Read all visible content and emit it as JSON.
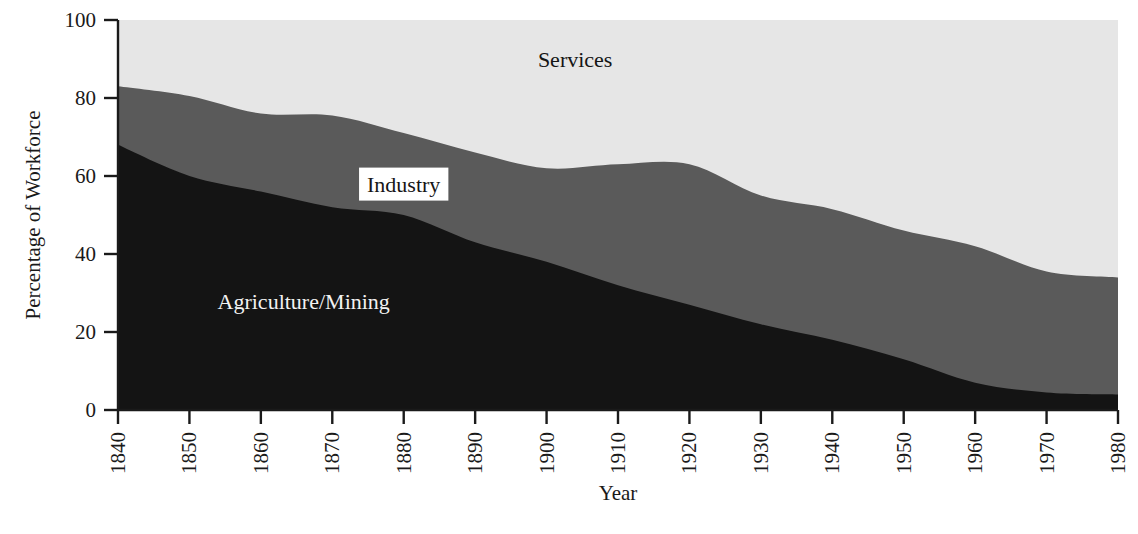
{
  "chart_data": {
    "type": "area",
    "title": "",
    "subtitle": "",
    "xlabel": "Year",
    "ylabel": "Percentage of Workforce",
    "stacked": true,
    "grid": false,
    "legend_position": "inline-labels",
    "xlim": [
      1840,
      1980
    ],
    "ylim": [
      0,
      100
    ],
    "x_ticks": [
      1840,
      1850,
      1860,
      1870,
      1880,
      1890,
      1900,
      1910,
      1920,
      1930,
      1940,
      1950,
      1960,
      1970,
      1980
    ],
    "y_ticks": [
      0,
      20,
      40,
      60,
      80,
      100
    ],
    "x": [
      1840,
      1850,
      1860,
      1870,
      1880,
      1890,
      1900,
      1910,
      1920,
      1930,
      1940,
      1950,
      1960,
      1970,
      1980
    ],
    "series": [
      {
        "name": "Agriculture/Mining",
        "color": "#141414",
        "label_color": "#f2f2f2",
        "values": [
          68,
          60,
          56,
          52,
          50,
          43,
          38,
          32,
          27,
          22,
          18,
          13,
          7,
          4.5,
          4
        ]
      },
      {
        "name": "Industry",
        "color": "#5a5a5a",
        "label_color": "#151515",
        "values": [
          15,
          20.5,
          20,
          23.5,
          21,
          23,
          24,
          31,
          36,
          33,
          33.5,
          33,
          35,
          31,
          30
        ]
      },
      {
        "name": "Services",
        "color": "#e6e6e6",
        "label_color": "#151515",
        "values": [
          17,
          19.5,
          24,
          24.5,
          29,
          34,
          38,
          37,
          37,
          45,
          48.5,
          54,
          58,
          64.5,
          66
        ]
      }
    ],
    "cumulative_tops": {
      "agriculture_mining": [
        68,
        60,
        56,
        52,
        50,
        43,
        38,
        32,
        27,
        22,
        18,
        13,
        7,
        4.5,
        4
      ],
      "industry": [
        83,
        80.5,
        76,
        75.5,
        71,
        66,
        62,
        63,
        63,
        55,
        51.5,
        46,
        42,
        35.5,
        34
      ],
      "services": [
        100,
        100,
        100,
        100,
        100,
        100,
        100,
        100,
        100,
        100,
        100,
        100,
        100,
        100,
        100
      ]
    },
    "annotations": [
      {
        "name": "Services",
        "x": 1904,
        "y": 88,
        "style": "plain"
      },
      {
        "name": "Industry",
        "x": 1880,
        "y": 56,
        "style": "boxed-white"
      },
      {
        "name": "Agriculture/Mining",
        "x": 1866,
        "y": 26,
        "style": "plain"
      }
    ]
  },
  "axes": {
    "y_tick_labels": [
      "100",
      "80",
      "60",
      "40",
      "20",
      "0"
    ],
    "x_tick_labels": [
      "1840",
      "1850",
      "1860",
      "1870",
      "1880",
      "1890",
      "1900",
      "1910",
      "1920",
      "1930",
      "1940",
      "1950",
      "1960",
      "1970",
      "1980"
    ],
    "y_axis_title": "Percentage of Workforce",
    "x_axis_title": "Year"
  },
  "labels": {
    "services": "Services",
    "industry": "Industry",
    "agriculture_mining": "Agriculture/Mining"
  },
  "colors": {
    "agriculture_mining": "#141414",
    "industry": "#5a5a5a",
    "services": "#e6e6e6",
    "axis": "#1a1a1a",
    "background": "#ffffff",
    "industry_label_box": "#ffffff"
  }
}
